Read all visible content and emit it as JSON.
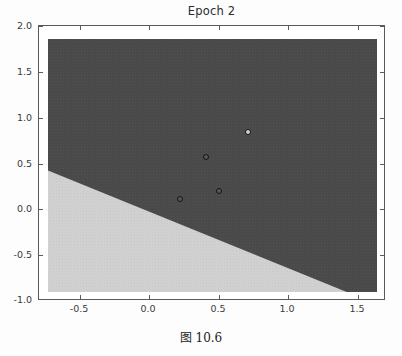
{
  "figure": {
    "caption": "图 10.6",
    "background": "#ffffff"
  },
  "chart_data": {
    "type": "scatter",
    "title": "Epoch 2",
    "xlabel": "",
    "ylabel": "",
    "xlim": [
      -0.8,
      1.7
    ],
    "ylim": [
      -1.0,
      2.0
    ],
    "xticks": [
      -0.5,
      0.0,
      0.5,
      1.0,
      1.5
    ],
    "xticklabels": [
      "-0.5",
      "0.0",
      "0.5",
      "1.0",
      "1.5"
    ],
    "yticks": [
      -1.0,
      -0.5,
      0.0,
      0.5,
      1.0,
      1.5,
      2.0
    ],
    "yticklabels": [
      "-1.0",
      "-0.5",
      "0.0",
      "0.5",
      "1.0",
      "1.5",
      "2.0"
    ],
    "grid": false,
    "legend": false,
    "colors": {
      "region_dark": "#4a4a4a",
      "region_light": "#d0d0d0",
      "marker_edge": "#141414",
      "axis": "#5a5a5a",
      "text": "#2b2b2b"
    },
    "decision_regions": {
      "description": "Two-class decision surface split by a straight boundary; upper-right region dark, lower-left region light.",
      "boundary_points": [
        {
          "x": -0.8,
          "y": 0.44
        },
        {
          "x": 1.47,
          "y": -1.0
        }
      ],
      "regions": [
        {
          "label": "class-1",
          "color": "#4a4a4a",
          "side": "upper-right"
        },
        {
          "label": "class-0",
          "color": "#d0d0d0",
          "side": "lower-left"
        }
      ]
    },
    "points": [
      {
        "x": 0.2,
        "y": 0.1,
        "cls": "dark"
      },
      {
        "x": 0.4,
        "y": 0.6,
        "cls": "dark"
      },
      {
        "x": 0.5,
        "y": 0.2,
        "cls": "dark"
      },
      {
        "x": 0.72,
        "y": 0.9,
        "cls": "light"
      }
    ]
  }
}
